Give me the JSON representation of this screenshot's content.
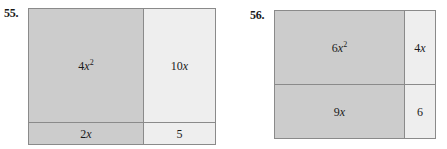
{
  "page": {
    "width": 447,
    "height": 149,
    "background": "#ffffff"
  },
  "colors": {
    "dark_fill": "#cccccc",
    "light_fill": "#eeeeee",
    "stroke": "#8a8a8a",
    "text": "#1a1a1a"
  },
  "problems": [
    {
      "number": "55.",
      "figure_name": "algebra-tile-area-model-55",
      "regions": [
        {
          "name": "region-4x-squared",
          "label_html": "4<i>x</i><sup>2</sup>",
          "label_text": "4x2",
          "fill": "dark"
        },
        {
          "name": "region-10x",
          "label_html": "10<i>x</i>",
          "label_text": "10x",
          "fill": "light"
        },
        {
          "name": "region-2x",
          "label_html": "2<i>x</i>",
          "label_text": "2x",
          "fill": "dark"
        },
        {
          "name": "region-5",
          "label_html": "5",
          "label_text": "5",
          "fill": "light"
        }
      ]
    },
    {
      "number": "56.",
      "figure_name": "algebra-tile-area-model-56",
      "regions": [
        {
          "name": "region-6x-squared",
          "label_html": "6<i>x</i><sup>2</sup>",
          "label_text": "6x2",
          "fill": "dark"
        },
        {
          "name": "region-4x",
          "label_html": "4<i>x</i>",
          "label_text": "4x",
          "fill": "light"
        },
        {
          "name": "region-9x",
          "label_html": "9<i>x</i>",
          "label_text": "9x",
          "fill": "dark"
        },
        {
          "name": "region-6",
          "label_html": "6",
          "label_text": "6",
          "fill": "light"
        }
      ]
    }
  ]
}
